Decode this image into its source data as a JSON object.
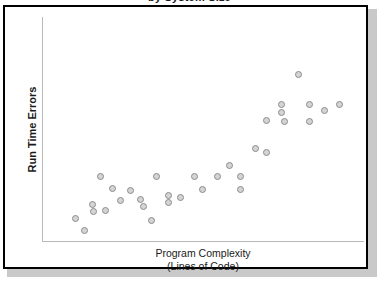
{
  "figure": {
    "frame_color": "#000000",
    "background_color": "#ffffff",
    "shadow_color": "#c9c9c9"
  },
  "marker_style": {
    "fill": "#d4d4d4",
    "stroke": "#8c8c8c",
    "diameter_px": 7
  },
  "chart_data": {
    "type": "scatter",
    "title": "by System Size",
    "subtitle": "",
    "xlabel": "Program Complexity",
    "xlabel_line2": "(Lines of Code)",
    "ylabel": "Run Time Errors",
    "grid": false,
    "legend": null,
    "xlim": [
      0,
      100
    ],
    "ylim": [
      0,
      100
    ],
    "axis_ticks": {
      "x": [],
      "y": []
    },
    "series": [
      {
        "name": "systems",
        "points": [
          {
            "x": 1.6,
            "y": 11.6
          },
          {
            "x": 6.2,
            "y": 5.8
          },
          {
            "x": 10.9,
            "y": 18.2
          },
          {
            "x": 11.2,
            "y": 15.1
          },
          {
            "x": 14.9,
            "y": 31.6
          },
          {
            "x": 18.0,
            "y": 15.6
          },
          {
            "x": 22.0,
            "y": 25.8
          },
          {
            "x": 26.4,
            "y": 20.0
          },
          {
            "x": 32.0,
            "y": 24.9
          },
          {
            "x": 38.0,
            "y": 20.4
          },
          {
            "x": 39.8,
            "y": 17.3
          },
          {
            "x": 44.1,
            "y": 10.7
          },
          {
            "x": 46.9,
            "y": 31.6
          },
          {
            "x": 53.9,
            "y": 22.7
          },
          {
            "x": 53.9,
            "y": 19.1
          },
          {
            "x": 60.9,
            "y": 21.3
          },
          {
            "x": 68.9,
            "y": 31.6
          },
          {
            "x": 73.0,
            "y": 25.3
          },
          {
            "x": 82.0,
            "y": 31.6
          },
          {
            "x": 88.9,
            "y": 36.9
          },
          {
            "x": 95.0,
            "y": 31.6
          },
          {
            "x": 95.0,
            "y": 25.3
          },
          {
            "x": 103.1,
            "y": 44.9
          },
          {
            "x": 110.0,
            "y": 42.7
          },
          {
            "x": 110.0,
            "y": 58.2
          },
          {
            "x": 118.9,
            "y": 61.8
          },
          {
            "x": 118.9,
            "y": 65.8
          },
          {
            "x": 120.0,
            "y": 57.8
          },
          {
            "x": 128.0,
            "y": 80.0
          },
          {
            "x": 134.8,
            "y": 65.8
          },
          {
            "x": 134.8,
            "y": 57.8
          },
          {
            "x": 143.8,
            "y": 62.7
          },
          {
            "x": 152.0,
            "y": 65.8
          }
        ]
      }
    ]
  },
  "points_px": [
    {
      "x": 44,
      "y": 215
    },
    {
      "x": 55,
      "y": 228
    },
    {
      "x": 66,
      "y": 200
    },
    {
      "x": 67,
      "y": 207
    },
    {
      "x": 76,
      "y": 170
    },
    {
      "x": 83,
      "y": 206
    },
    {
      "x": 92,
      "y": 183
    },
    {
      "x": 102,
      "y": 196
    },
    {
      "x": 115,
      "y": 185
    },
    {
      "x": 129,
      "y": 195
    },
    {
      "x": 133,
      "y": 202
    },
    {
      "x": 143,
      "y": 217
    },
    {
      "x": 149,
      "y": 170
    },
    {
      "x": 165,
      "y": 190
    },
    {
      "x": 165,
      "y": 198
    },
    {
      "x": 181,
      "y": 193
    },
    {
      "x": 199,
      "y": 170
    },
    {
      "x": 209,
      "y": 184
    },
    {
      "x": 229,
      "y": 170
    },
    {
      "x": 245,
      "y": 158
    },
    {
      "x": 259,
      "y": 170
    },
    {
      "x": 259,
      "y": 184
    },
    {
      "x": 278,
      "y": 140
    },
    {
      "x": 293,
      "y": 145
    },
    {
      "x": 293,
      "y": 110
    },
    {
      "x": 313,
      "y": 102
    },
    {
      "x": 313,
      "y": 93
    },
    {
      "x": 316,
      "y": 111
    },
    {
      "x": 334,
      "y": 61
    },
    {
      "x": 349,
      "y": 93
    },
    {
      "x": 349,
      "y": 111
    },
    {
      "x": 369,
      "y": 100
    },
    {
      "x": 388,
      "y": 93
    }
  ]
}
